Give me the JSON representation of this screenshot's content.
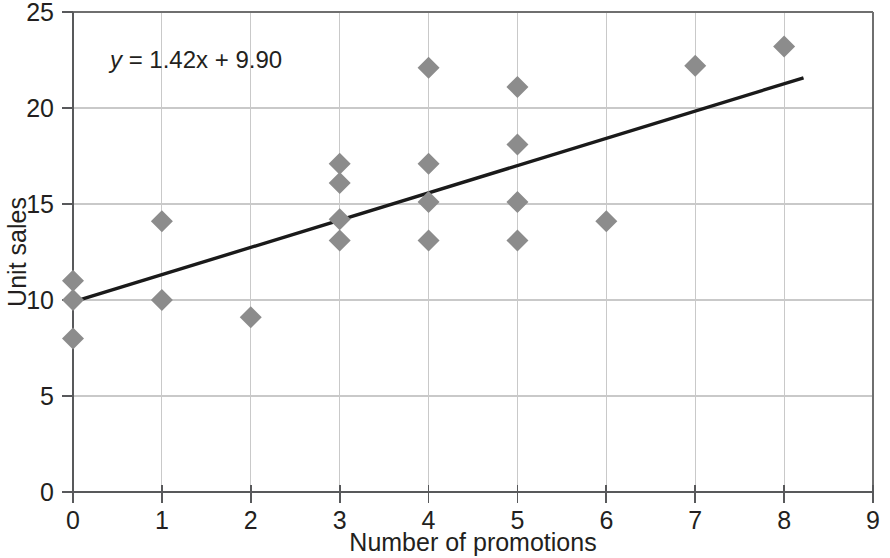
{
  "chart_data": {
    "type": "scatter",
    "title": "",
    "xlabel": "Number of promotions",
    "ylabel": "Unit sales",
    "xlim": [
      0,
      9
    ],
    "ylim": [
      0,
      25
    ],
    "xticks": [
      0,
      1,
      2,
      3,
      4,
      5,
      6,
      7,
      8,
      9
    ],
    "xtick_labels": [
      "0",
      "1",
      "2",
      "3",
      "4",
      "5",
      "6",
      "7",
      "8",
      "9"
    ],
    "yticks": [
      0,
      5,
      10,
      15,
      20,
      25
    ],
    "ytick_labels": [
      "0",
      "5",
      "10",
      "15",
      "20",
      "25"
    ],
    "grid": true,
    "grid_color": "#c9c9c9",
    "legend": null,
    "marker_shape": "diamond",
    "marker_color": "#8c8c8c",
    "points": [
      {
        "x": 0,
        "y": 11.0
      },
      {
        "x": 0,
        "y": 10.0
      },
      {
        "x": 0,
        "y": 8.0
      },
      {
        "x": 1,
        "y": 14.1
      },
      {
        "x": 1,
        "y": 10.0
      },
      {
        "x": 2,
        "y": 9.1
      },
      {
        "x": 3,
        "y": 17.1
      },
      {
        "x": 3,
        "y": 16.1
      },
      {
        "x": 3,
        "y": 14.2
      },
      {
        "x": 3,
        "y": 13.1
      },
      {
        "x": 4,
        "y": 22.1
      },
      {
        "x": 4,
        "y": 17.1
      },
      {
        "x": 4,
        "y": 15.1
      },
      {
        "x": 4,
        "y": 13.1
      },
      {
        "x": 5,
        "y": 21.1
      },
      {
        "x": 5,
        "y": 18.1
      },
      {
        "x": 5,
        "y": 15.1
      },
      {
        "x": 5,
        "y": 13.1
      },
      {
        "x": 6,
        "y": 14.1
      },
      {
        "x": 7,
        "y": 22.2
      },
      {
        "x": 8,
        "y": 23.2
      }
    ],
    "trendline": {
      "type": "linear",
      "slope": 1.42,
      "intercept": 9.9,
      "x_start": 0,
      "x_end": 8.2,
      "color": "#1a1a1a",
      "equation": "y = 1.42x + 9.90",
      "equation_parts": {
        "variable": "y",
        "rest": " = 1.42x + 9.90"
      }
    }
  },
  "annotations": {
    "equation_label": "y = 1.42x + 9.90"
  }
}
